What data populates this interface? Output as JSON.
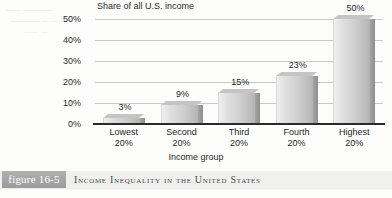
{
  "chart_data": {
    "type": "bar",
    "title": "Income Inequality in the United States",
    "ylabel": "Share of all U.S. income",
    "xlabel": "Income group",
    "categories": [
      "Lowest 20%",
      "Second 20%",
      "Third 20%",
      "Fourth 20%",
      "Highest 20%"
    ],
    "category_lines": [
      [
        "Lowest",
        "20%"
      ],
      [
        "Second",
        "20%"
      ],
      [
        "Third",
        "20%"
      ],
      [
        "Fourth",
        "20%"
      ],
      [
        "Highest",
        "20%"
      ]
    ],
    "values": [
      3,
      9,
      15,
      23,
      50
    ],
    "value_labels": [
      "3%",
      "9%",
      "15%",
      "23%",
      "50%"
    ],
    "ylim": [
      0,
      50
    ],
    "yticks": [
      50,
      40,
      30,
      20,
      10,
      0
    ],
    "ytick_labels": [
      "50%",
      "40%",
      "30%",
      "20%",
      "10%",
      "0%"
    ],
    "grid": true,
    "legend": "none"
  },
  "figure": {
    "badge_label": "figure 16-5",
    "caption": "Income Inequality in the United States"
  },
  "ghost_text": {
    "line1": "—— ————",
    "line2": "———— — ——",
    "line3": "—— —"
  },
  "colors": {
    "page_background": "#fdfdfc",
    "bar_front_light": "#efefef",
    "bar_front_dark": "#b3b3b3",
    "bar_side": "#9a9a9a",
    "bar_top": "#c4c4c4",
    "gridline": "#c9c9c9",
    "axis": "#2b2b2b",
    "badge_background": "#a6a6a6",
    "badge_text": "#ffffff",
    "caption_strip": "#f0f0ee",
    "caption_text": "#4b4b4b"
  }
}
